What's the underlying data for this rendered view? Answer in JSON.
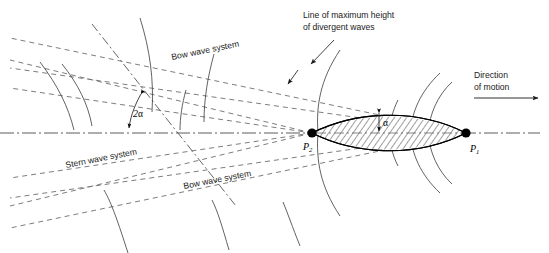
{
  "figure": {
    "title_cut_off": "",
    "background_color": "#ffffff",
    "ink_color": "#000000",
    "dash_color": "#6e6e6e"
  },
  "labels": {
    "line_max_height_1": "Line of maximum height",
    "line_max_height_2": "of divergent waves",
    "bow_wave_upper": "Bow wave system",
    "bow_wave_lower": "Bow wave system",
    "stern_wave": "Stern wave system",
    "direction_1": "Direction",
    "direction_2": "of motion",
    "angle_two_alpha": "2",
    "angle_two_alpha_symbol": "α",
    "angle_alpha_symbol": "α",
    "point_stern_base": "P",
    "point_stern_sub": "2",
    "point_bow_base": "P",
    "point_bow_sub": "1"
  },
  "geometry": {
    "axis_y": 133,
    "stern_point_x": 312,
    "stern_point_y": 133,
    "bow_point_x": 466,
    "bow_point_y": 133,
    "apex_x": 141,
    "apex_y": 92,
    "half_angle_deg": 19.5
  },
  "icons": {
    "direction_arrow": "arrow-right",
    "leader_arrow": "arrow-pointer"
  }
}
